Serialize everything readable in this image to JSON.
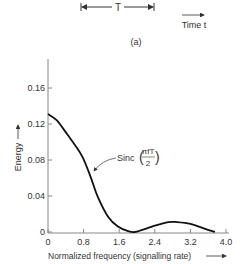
{
  "header": {
    "period_label": "T",
    "time_label": "Time t",
    "subfigure_label": "(a)"
  },
  "chart_data": {
    "type": "line",
    "title": "",
    "xlabel": "Normalized frequency (signalling rate)",
    "ylabel": "Energy",
    "xlim": [
      0,
      4.0
    ],
    "ylim": [
      0,
      0.18
    ],
    "x_ticks": [
      "0",
      "0.8",
      "1.6",
      "2.4",
      "3.2",
      "4.0"
    ],
    "y_ticks": [
      "0",
      "0.04",
      "0.08",
      "0.12",
      "0.16"
    ],
    "grid": false,
    "legend": null,
    "annotations": [
      {
        "text": "Sinc(πfT/2)",
        "numerator": "πfT",
        "denominator": "2",
        "prefix": "Sinc",
        "points_to": [
          0.96,
          0.061
        ]
      }
    ],
    "series": [
      {
        "name": "Sinc(πfT/2)",
        "x": [
          0,
          0.2,
          0.44,
          0.6,
          0.78,
          0.96,
          1.12,
          1.35,
          1.57,
          1.8,
          1.95,
          2.1,
          2.4,
          2.7,
          2.9,
          3.2,
          3.5,
          3.75
        ],
        "y": [
          0.131,
          0.124,
          0.108,
          0.097,
          0.083,
          0.061,
          0.039,
          0.017,
          0.006,
          0.001,
          0.0,
          0.002,
          0.007,
          0.011,
          0.011,
          0.009,
          0.004,
          0.0
        ]
      }
    ]
  }
}
